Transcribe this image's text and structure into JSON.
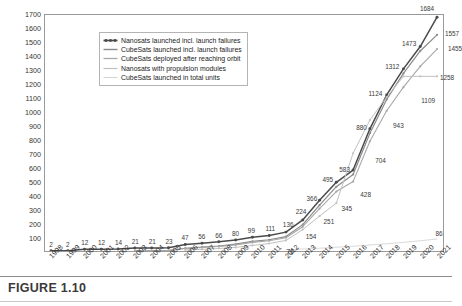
{
  "figure": {
    "caption": "FIGURE 1.10"
  },
  "chart_data": {
    "type": "line",
    "title": "",
    "xlabel": "",
    "ylabel": "Running total of satellites",
    "ylim": [
      0,
      1700
    ],
    "ytick_step": 100,
    "grid": false,
    "legend_position": "top-left",
    "categories": [
      "1998",
      "1999",
      "2000",
      "2001",
      "2002",
      "2003",
      "2004",
      "2005",
      "2006",
      "2007",
      "2008",
      "2009",
      "2010",
      "2011",
      "2012",
      "2013",
      "2014",
      "2015",
      "2016",
      "2017",
      "2018",
      "2019",
      "2020",
      "2021"
    ],
    "yticks": [
      "1700",
      "1600",
      "1500",
      "1400",
      "1300",
      "1200",
      "1100",
      "1000",
      "900",
      "800",
      "700",
      "600",
      "500",
      "400",
      "300",
      "200",
      "100"
    ],
    "series": [
      {
        "name": "Nanosats launched incl. launch failures",
        "color": "#4a4a4a",
        "values": [
          2,
          2,
          12,
          12,
          14,
          21,
          21,
          23,
          47,
          56,
          66,
          80,
          99,
          111,
          136,
          224,
          366,
          495,
          583,
          880,
          1124,
          1312,
          1473,
          1684
        ],
        "labels": [
          "2",
          "2",
          "12",
          "12",
          "14",
          "21",
          "21",
          "23",
          "47",
          "56",
          "66",
          "80",
          "99",
          "111",
          "136",
          "224",
          "366",
          "495",
          "583",
          "880",
          "1124",
          "1312",
          "1473",
          "1684"
        ]
      },
      {
        "name": "CubeSats launched incl. launch failures",
        "color": "#8a8a8a",
        "values": [
          null,
          null,
          null,
          null,
          null,
          1,
          1,
          3,
          20,
          28,
          36,
          50,
          69,
          81,
          104,
          190,
          330,
          463,
          551,
          848,
          1092,
          1280,
          1441,
          1557
        ],
        "labels": [
          "",
          "",
          "",
          "",
          "",
          "",
          "",
          "",
          "",
          "",
          "",
          "",
          "",
          "",
          "",
          "",
          "",
          "",
          "",
          "",
          "",
          "",
          "",
          "1557"
        ]
      },
      {
        "name": "CubeSats deployed after reaching orbit",
        "color": "#a8a8a8",
        "values": [
          null,
          null,
          null,
          null,
          null,
          1,
          1,
          3,
          18,
          25,
          32,
          44,
          62,
          74,
          96,
          175,
          305,
          428,
          500,
          790,
          1010,
          1180,
          1330,
          1455
        ],
        "labels": [
          "",
          "",
          "",
          "",
          "",
          "",
          "",
          "",
          "",
          "",
          "",
          "",
          "",
          "",
          "",
          "",
          "",
          "428",
          "",
          "",
          "",
          "",
          "",
          "1455"
        ]
      },
      {
        "name": "Nanosats with propulsion modules",
        "color": "#c0c0c0",
        "values": [
          null,
          null,
          null,
          null,
          null,
          null,
          null,
          null,
          8,
          12,
          18,
          26,
          40,
          54,
          76,
          154,
          251,
          345,
          704,
          943,
          1109,
          1258,
          1258,
          1258
        ],
        "labels": [
          "",
          "",
          "",
          "",
          "",
          "",
          "",
          "",
          "",
          "",
          "",
          "",
          "",
          "",
          "76",
          "154",
          "251",
          "345",
          "704",
          "943",
          "1109",
          "1258",
          "",
          ""
        ]
      },
      {
        "name": "CubeSats launched in total units",
        "color": "#d4d4d4",
        "values": [
          null,
          null,
          null,
          null,
          null,
          null,
          null,
          null,
          null,
          null,
          null,
          null,
          null,
          null,
          10,
          14,
          20,
          27,
          34,
          43,
          52,
          62,
          74,
          86
        ],
        "labels": [
          "",
          "",
          "",
          "",
          "",
          "",
          "",
          "",
          "",
          "",
          "",
          "",
          "",
          "",
          "",
          "",
          "",
          "",
          "",
          "",
          "",
          "",
          "",
          "86"
        ]
      }
    ],
    "annotations": [
      {
        "text": "2",
        "x": 0,
        "y": 2,
        "dx": 0,
        "dy": -9
      },
      {
        "text": "2",
        "x": 1,
        "y": 2,
        "dx": 0,
        "dy": -9
      },
      {
        "text": "12",
        "x": 2,
        "y": 12,
        "dx": 0,
        "dy": -9
      },
      {
        "text": "12",
        "x": 3,
        "y": 12,
        "dx": 0,
        "dy": -9
      },
      {
        "text": "14",
        "x": 4,
        "y": 14,
        "dx": 0,
        "dy": -9
      },
      {
        "text": "21",
        "x": 5,
        "y": 21,
        "dx": 0,
        "dy": -9
      },
      {
        "text": "21",
        "x": 6,
        "y": 21,
        "dx": 0,
        "dy": -9
      },
      {
        "text": "23",
        "x": 7,
        "y": 23,
        "dx": 0,
        "dy": -9
      },
      {
        "text": "47",
        "x": 8,
        "y": 47,
        "dx": -1,
        "dy": -9
      },
      {
        "text": "56",
        "x": 9,
        "y": 56,
        "dx": -1,
        "dy": -9
      },
      {
        "text": "66",
        "x": 10,
        "y": 66,
        "dx": -1,
        "dy": -9
      },
      {
        "text": "80",
        "x": 11,
        "y": 80,
        "dx": -1,
        "dy": -9
      },
      {
        "text": "99",
        "x": 12,
        "y": 99,
        "dx": -2,
        "dy": -9
      },
      {
        "text": "111",
        "x": 13,
        "y": 111,
        "dx": 0,
        "dy": -9
      },
      {
        "text": "136",
        "x": 14,
        "y": 136,
        "dx": 1,
        "dy": -10
      },
      {
        "text": "224",
        "x": 15,
        "y": 224,
        "dx": -3,
        "dy": -11
      },
      {
        "text": "366",
        "x": 16,
        "y": 366,
        "dx": -9,
        "dy": -4
      },
      {
        "text": "495",
        "x": 17,
        "y": 495,
        "dx": -10,
        "dy": -5
      },
      {
        "text": "583",
        "x": 18,
        "y": 583,
        "dx": -10,
        "dy": -2
      },
      {
        "text": "880",
        "x": 19,
        "y": 880,
        "dx": -10,
        "dy": -3
      },
      {
        "text": "1124",
        "x": 20,
        "y": 1124,
        "dx": -13,
        "dy": -3
      },
      {
        "text": "1312",
        "x": 21,
        "y": 1312,
        "dx": -13,
        "dy": -3
      },
      {
        "text": "1473",
        "x": 22,
        "y": 1473,
        "dx": -13,
        "dy": -4
      },
      {
        "text": "1684",
        "x": 23,
        "y": 1684,
        "dx": -12,
        "dy": -9
      },
      {
        "text": "1557",
        "x": 23,
        "y": 1557,
        "dx": 13,
        "dy": -2
      },
      {
        "text": "1455",
        "x": 23,
        "y": 1455,
        "dx": 16,
        "dy": -1
      },
      {
        "text": "1258",
        "x": 23,
        "y": 1258,
        "dx": 8,
        "dy": 0
      },
      {
        "text": "1109",
        "x": 22,
        "y": 1109,
        "dx": 6,
        "dy": 2
      },
      {
        "text": "943",
        "x": 20,
        "y": 943,
        "dx": 10,
        "dy": 4
      },
      {
        "text": "704",
        "x": 19,
        "y": 704,
        "dx": 9,
        "dy": 6
      },
      {
        "text": "428",
        "x": 18,
        "y": 428,
        "dx": 11,
        "dy": 1
      },
      {
        "text": "345",
        "x": 17,
        "y": 345,
        "dx": 9,
        "dy": 3
      },
      {
        "text": "251",
        "x": 16,
        "y": 251,
        "dx": 8,
        "dy": 3
      },
      {
        "text": "154",
        "x": 15,
        "y": 154,
        "dx": 7,
        "dy": 5
      },
      {
        "text": "76",
        "x": 14,
        "y": 76,
        "dx": 3,
        "dy": 9
      },
      {
        "text": "86",
        "x": 23,
        "y": 86,
        "dx": 0,
        "dy": -8
      }
    ]
  }
}
